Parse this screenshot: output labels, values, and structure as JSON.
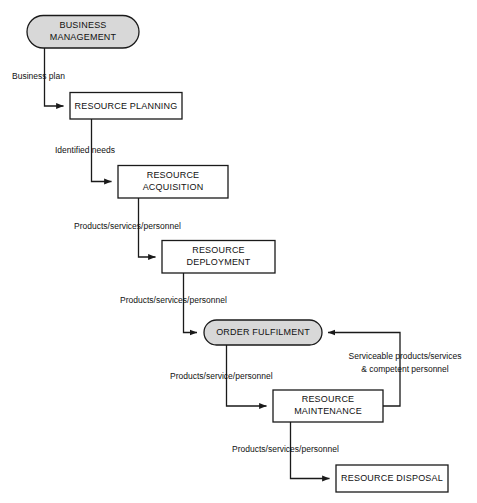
{
  "diagram": {
    "type": "flowchart",
    "background_color": "#ffffff",
    "line_color": "#1a1a1a",
    "text_color": "#111111",
    "stadium_fill": "#d8d8d8",
    "rect_fill": "#ffffff",
    "nodes": [
      {
        "id": "business-management",
        "shape": "stadium",
        "lines": [
          "BUSINESS",
          "MANAGEMENT"
        ],
        "line1": "BUSINESS",
        "line2": "MANAGEMENT"
      },
      {
        "id": "resource-planning",
        "shape": "rectangle",
        "lines": [
          "RESOURCE PLANNING"
        ],
        "line1": "RESOURCE PLANNING",
        "line2": ""
      },
      {
        "id": "resource-acquisition",
        "shape": "rectangle",
        "lines": [
          "RESOURCE",
          "ACQUISITION"
        ],
        "line1": "RESOURCE",
        "line2": "ACQUISITION"
      },
      {
        "id": "resource-deployment",
        "shape": "rectangle",
        "lines": [
          "RESOURCE",
          "DEPLOYMENT"
        ],
        "line1": "RESOURCE",
        "line2": "DEPLOYMENT"
      },
      {
        "id": "order-fulfilment",
        "shape": "stadium",
        "lines": [
          "ORDER FULFILMENT"
        ],
        "line1": "ORDER FULFILMENT",
        "line2": ""
      },
      {
        "id": "resource-maintenance",
        "shape": "rectangle",
        "lines": [
          "RESOURCE",
          "MAINTENANCE"
        ],
        "line1": "RESOURCE",
        "line2": "MAINTENANCE"
      },
      {
        "id": "resource-disposal",
        "shape": "rectangle",
        "lines": [
          "RESOURCE DISPOSAL"
        ],
        "line1": "RESOURCE DISPOSAL",
        "line2": ""
      }
    ],
    "edges": [
      {
        "id": "edge-business-plan",
        "from": "business-management",
        "to": "resource-planning",
        "label": "Business plan",
        "label_line1": "Business plan",
        "label_line2": ""
      },
      {
        "id": "edge-identified-needs",
        "from": "resource-planning",
        "to": "resource-acquisition",
        "label": "Identified needs",
        "label_line1": "Identified needs",
        "label_line2": ""
      },
      {
        "id": "edge-acquisition-deployment",
        "from": "resource-acquisition",
        "to": "resource-deployment",
        "label": "Products/services/personnel",
        "label_line1": "Products/services/personnel",
        "label_line2": ""
      },
      {
        "id": "edge-deployment-fulfilment",
        "from": "resource-deployment",
        "to": "order-fulfilment",
        "label": "Products/services/personnel",
        "label_line1": "Products/services/personnel",
        "label_line2": ""
      },
      {
        "id": "edge-fulfilment-maintenance",
        "from": "order-fulfilment",
        "to": "resource-maintenance",
        "label": "Products/service/personnel",
        "label_line1": "Products/service/personnel",
        "label_line2": ""
      },
      {
        "id": "edge-maintenance-fulfilment",
        "from": "resource-maintenance",
        "to": "order-fulfilment",
        "label": "Serviceable products/services & competent personnel",
        "label_line1": "Serviceable products/services",
        "label_line2": "& competent personnel"
      },
      {
        "id": "edge-maintenance-disposal",
        "from": "resource-maintenance",
        "to": "resource-disposal",
        "label": "Products/services/personnel",
        "label_line1": "Products/services/personnel",
        "label_line2": ""
      }
    ]
  }
}
